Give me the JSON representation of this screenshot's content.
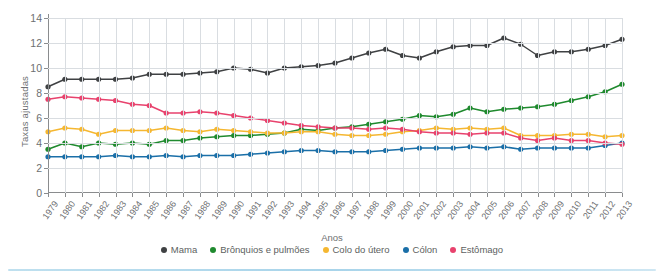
{
  "chart_data": {
    "type": "line",
    "title": "",
    "xlabel": "Anos",
    "ylabel": "Taxas ajustadas",
    "ylim": [
      0,
      14
    ],
    "yticks": [
      0,
      2,
      4,
      6,
      8,
      10,
      12,
      14
    ],
    "grid": true,
    "legend_position": "bottom",
    "categories": [
      "1979",
      "1980",
      "1981",
      "1982",
      "1983",
      "1984",
      "1985",
      "1986",
      "1987",
      "1988",
      "1989",
      "1990",
      "1991",
      "1992",
      "1993",
      "1994",
      "1995",
      "1996",
      "1997",
      "1998",
      "1999",
      "2000",
      "2001",
      "2002",
      "2003",
      "2004",
      "2005",
      "2006",
      "2007",
      "2008",
      "2009",
      "2010",
      "2011",
      "2012",
      "2013"
    ],
    "series": [
      {
        "name": "Mama",
        "color": "#3f4143",
        "values": [
          8.5,
          9.1,
          9.1,
          9.1,
          9.1,
          9.2,
          9.5,
          9.5,
          9.5,
          9.6,
          9.7,
          10.0,
          9.9,
          9.6,
          10.0,
          10.1,
          10.2,
          10.4,
          10.8,
          11.2,
          11.5,
          11.0,
          10.8,
          11.3,
          11.7,
          11.8,
          11.8,
          12.4,
          11.9,
          11.0,
          11.3,
          11.3,
          11.5,
          11.8,
          12.3
        ]
      },
      {
        "name": "Brônquios e pulmões",
        "color": "#1f8a2e",
        "values": [
          3.5,
          4.0,
          3.7,
          4.0,
          3.9,
          4.0,
          3.9,
          4.2,
          4.2,
          4.4,
          4.5,
          4.6,
          4.6,
          4.7,
          4.8,
          5.1,
          5.0,
          5.2,
          5.3,
          5.5,
          5.7,
          5.9,
          6.2,
          6.1,
          6.3,
          6.8,
          6.5,
          6.7,
          6.8,
          6.9,
          7.1,
          7.4,
          7.7,
          8.1,
          8.7
        ]
      },
      {
        "name": "Colo do útero",
        "color": "#f5b731",
        "values": [
          4.9,
          5.2,
          5.1,
          4.7,
          5.0,
          5.0,
          5.0,
          5.2,
          5.0,
          4.9,
          5.1,
          5.0,
          4.9,
          4.8,
          4.8,
          4.9,
          4.9,
          4.7,
          4.6,
          4.6,
          4.7,
          4.9,
          5.0,
          5.2,
          5.1,
          5.2,
          5.1,
          5.2,
          4.6,
          4.6,
          4.6,
          4.7,
          4.7,
          4.5,
          4.6
        ]
      },
      {
        "name": "Cólon",
        "color": "#1a6fa8",
        "values": [
          2.9,
          2.9,
          2.9,
          2.9,
          3.0,
          2.9,
          2.9,
          3.0,
          2.9,
          3.0,
          3.0,
          3.0,
          3.1,
          3.2,
          3.3,
          3.4,
          3.4,
          3.3,
          3.3,
          3.3,
          3.4,
          3.5,
          3.6,
          3.6,
          3.6,
          3.7,
          3.6,
          3.7,
          3.5,
          3.6,
          3.6,
          3.6,
          3.6,
          3.8,
          4.0
        ]
      },
      {
        "name": "Estômago",
        "color": "#e8426d",
        "values": [
          7.5,
          7.7,
          7.6,
          7.5,
          7.4,
          7.1,
          7.0,
          6.4,
          6.4,
          6.5,
          6.4,
          6.2,
          6.0,
          5.8,
          5.6,
          5.4,
          5.3,
          5.2,
          5.2,
          5.1,
          5.2,
          5.1,
          4.9,
          4.8,
          4.8,
          4.7,
          4.8,
          4.8,
          4.4,
          4.2,
          4.4,
          4.2,
          4.2,
          4.0,
          3.9
        ]
      }
    ]
  }
}
